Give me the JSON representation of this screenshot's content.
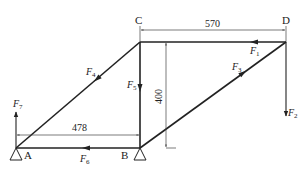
{
  "diagram": {
    "title": "",
    "nodes": {
      "A": {
        "label": "A",
        "x": 16,
        "y": 148
      },
      "B": {
        "label": "B",
        "x": 140,
        "y": 148
      },
      "C": {
        "label": "C",
        "x": 140,
        "y": 42
      },
      "D": {
        "label": "D",
        "x": 286,
        "y": 42
      }
    },
    "members": [
      {
        "id": "F1",
        "from": "D",
        "to": "C",
        "label": "F",
        "sub": "1"
      },
      {
        "id": "F3",
        "from": "B",
        "to": "D",
        "label": "F",
        "sub": "3"
      },
      {
        "id": "F4",
        "from": "C",
        "to": "A",
        "label": "F",
        "sub": "4"
      },
      {
        "id": "F5",
        "from": "C",
        "to": "B",
        "label": "F",
        "sub": "5"
      },
      {
        "id": "F6",
        "from": "B",
        "to": "A",
        "label": "F",
        "sub": "6"
      }
    ],
    "external_forces": [
      {
        "id": "F2",
        "at": "D",
        "direction": "down",
        "label": "F",
        "sub": "2"
      },
      {
        "id": "F7",
        "at": "A",
        "direction": "up",
        "label": "F",
        "sub": "7"
      }
    ],
    "dimensions": {
      "top": {
        "value": "570"
      },
      "vertical": {
        "value": "400"
      },
      "bottom": {
        "value": "478"
      }
    },
    "supports": [
      "A",
      "B"
    ],
    "colors": {
      "line": "#222222",
      "dim_line": "#444444",
      "background": "#ffffff"
    }
  }
}
